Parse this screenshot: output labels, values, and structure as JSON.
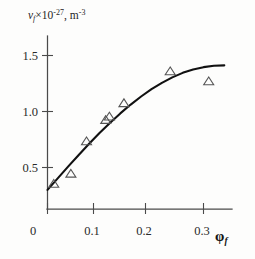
{
  "figure": {
    "ylabel_symbol": "ν",
    "ylabel_subscript": "f",
    "ylabel_times": "×10",
    "ylabel_exponent": "-27",
    "ylabel_units_comma": ", m",
    "ylabel_units_exponent": "-3",
    "xlabel_symbol": "φ",
    "xlabel_subscript": "f",
    "background_color": "#fdfdfc",
    "curve_color": "#111111",
    "marker_color": "#555555",
    "axis_color": "#4a4a4a"
  },
  "chart_data": {
    "type": "scatter",
    "title": "",
    "xlabel": "φ_f",
    "ylabel": "ν_f × 10^-27, m^-3",
    "xlim": [
      0.0,
      0.345
    ],
    "ylim": [
      0.0,
      1.62
    ],
    "xticks": [
      0,
      0.1,
      0.2,
      0.3
    ],
    "xtick_labels": [
      "0",
      "0.1",
      "0.2",
      "0.3"
    ],
    "yticks": [
      0.5,
      1.0,
      1.5
    ],
    "ytick_labels": [
      "0.5",
      "1.0",
      "1.5"
    ],
    "grid": false,
    "legend": false,
    "series": [
      {
        "name": "measured points",
        "marker": "triangle-up-open",
        "x": [
          0.012,
          0.045,
          0.075,
          0.112,
          0.119,
          0.147,
          0.236,
          0.31
        ],
        "y": [
          0.355,
          0.445,
          0.735,
          0.925,
          0.955,
          1.075,
          1.36,
          1.27
        ]
      },
      {
        "name": "fitted curve",
        "type": "line",
        "x": [
          0.0,
          0.02,
          0.04,
          0.06,
          0.08,
          0.1,
          0.12,
          0.14,
          0.16,
          0.18,
          0.2,
          0.22,
          0.24,
          0.26,
          0.28,
          0.3,
          0.32,
          0.34
        ],
        "y": [
          0.3,
          0.405,
          0.51,
          0.612,
          0.712,
          0.808,
          0.898,
          0.983,
          1.062,
          1.134,
          1.199,
          1.256,
          1.305,
          1.345,
          1.375,
          1.396,
          1.408,
          1.412
        ]
      }
    ]
  }
}
